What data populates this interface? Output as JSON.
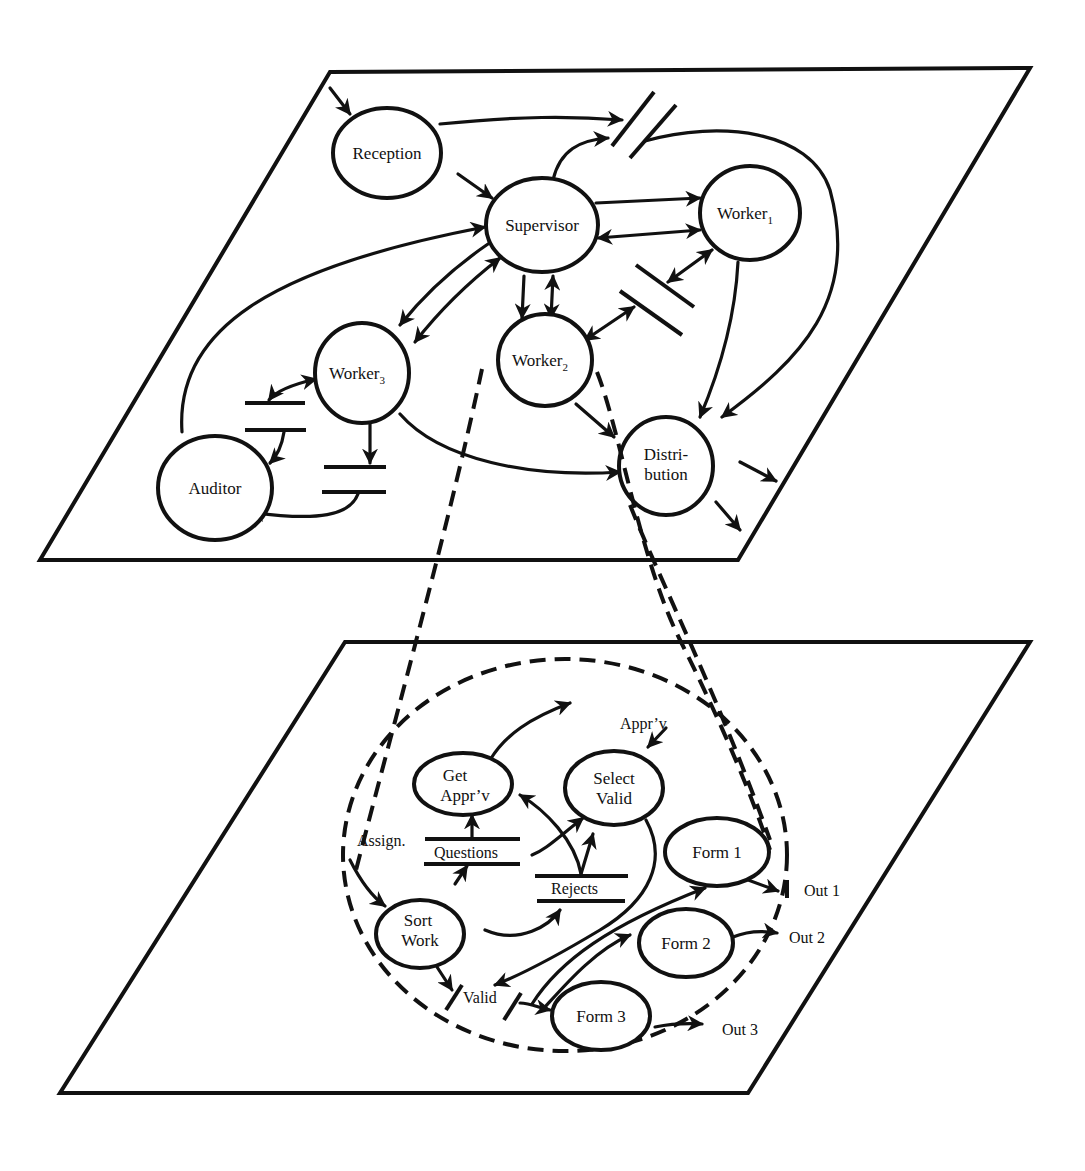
{
  "diagram": {
    "type": "data-flow-diagram",
    "top_level": {
      "nodes": {
        "reception": "Reception",
        "supervisor": "Supervisor",
        "worker1": "Worker",
        "worker1_sub": "1",
        "worker2": "Worker",
        "worker2_sub": "2",
        "worker3": "Worker",
        "worker3_sub": "3",
        "auditor": "Auditor",
        "distribution_line1": "Distri-",
        "distribution_line2": "bution"
      },
      "flows": [
        {
          "from": "external",
          "to": "Reception"
        },
        {
          "from": "Reception",
          "to": "Supervisor"
        },
        {
          "from": "Reception",
          "to": "store-top"
        },
        {
          "from": "Supervisor",
          "to": "store-top"
        },
        {
          "from": "store-top",
          "to": "Distribution"
        },
        {
          "from": "Supervisor",
          "to": "Worker1"
        },
        {
          "from": "Worker1",
          "to": "Supervisor",
          "bidirectional": true
        },
        {
          "from": "Worker1",
          "to": "store-mid",
          "bidirectional": true
        },
        {
          "from": "store-mid",
          "to": "Worker2",
          "bidirectional": true
        },
        {
          "from": "Worker1",
          "to": "Distribution"
        },
        {
          "from": "Supervisor",
          "to": "Worker2"
        },
        {
          "from": "Supervisor",
          "to": "Worker2",
          "bidirectional": true
        },
        {
          "from": "Supervisor",
          "to": "Worker3"
        },
        {
          "from": "Worker3",
          "to": "Supervisor",
          "bidirectional": true
        },
        {
          "from": "Auditor",
          "to": "Supervisor"
        },
        {
          "from": "Worker3",
          "to": "store-left",
          "bidirectional": true
        },
        {
          "from": "store-left",
          "to": "Auditor"
        },
        {
          "from": "Worker3",
          "to": "store-bottom"
        },
        {
          "from": "store-bottom",
          "to": "Auditor"
        },
        {
          "from": "Worker3",
          "to": "Distribution"
        },
        {
          "from": "Worker2",
          "to": "Distribution"
        },
        {
          "from": "Distribution",
          "to": "external"
        },
        {
          "from": "Distribution",
          "to": "external"
        }
      ]
    },
    "expanded_level": {
      "expands": "Worker2",
      "nodes": {
        "get_apprv_line1": "Get",
        "get_apprv_line2": "Appr’v",
        "select_valid_line1": "Select",
        "select_valid_line2": "Valid",
        "sort_work_line1": "Sort",
        "sort_work_line2": "Work",
        "form1": "Form 1",
        "form2": "Form 2",
        "form3": "Form 3"
      },
      "stores": {
        "questions": "Questions",
        "rejects": "Rejects",
        "valid": "Valid"
      },
      "labels": {
        "assign": "Assign.",
        "apprv_in": "Appr’v",
        "out1": "Out 1",
        "out2": "Out 2",
        "out3": "Out 3"
      }
    }
  }
}
